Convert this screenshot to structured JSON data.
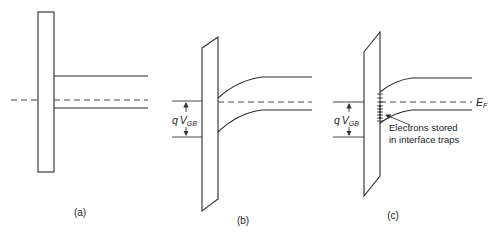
{
  "figure": {
    "panels": [
      {
        "id": "a",
        "label": "(a)"
      },
      {
        "id": "b",
        "label": "(b)",
        "voltage_label": {
          "q": "q",
          "V": "V",
          "sub": "GB"
        }
      },
      {
        "id": "c",
        "label": "(c)",
        "voltage_label": {
          "q": "q",
          "V": "V",
          "sub": "GB"
        },
        "fermi_label": {
          "E": "E",
          "sub": "F"
        },
        "annotation": [
          "Electrons stored",
          "in interface traps"
        ]
      }
    ],
    "colors": {
      "line": "#2a2a2a",
      "background": "#ffffff"
    }
  }
}
